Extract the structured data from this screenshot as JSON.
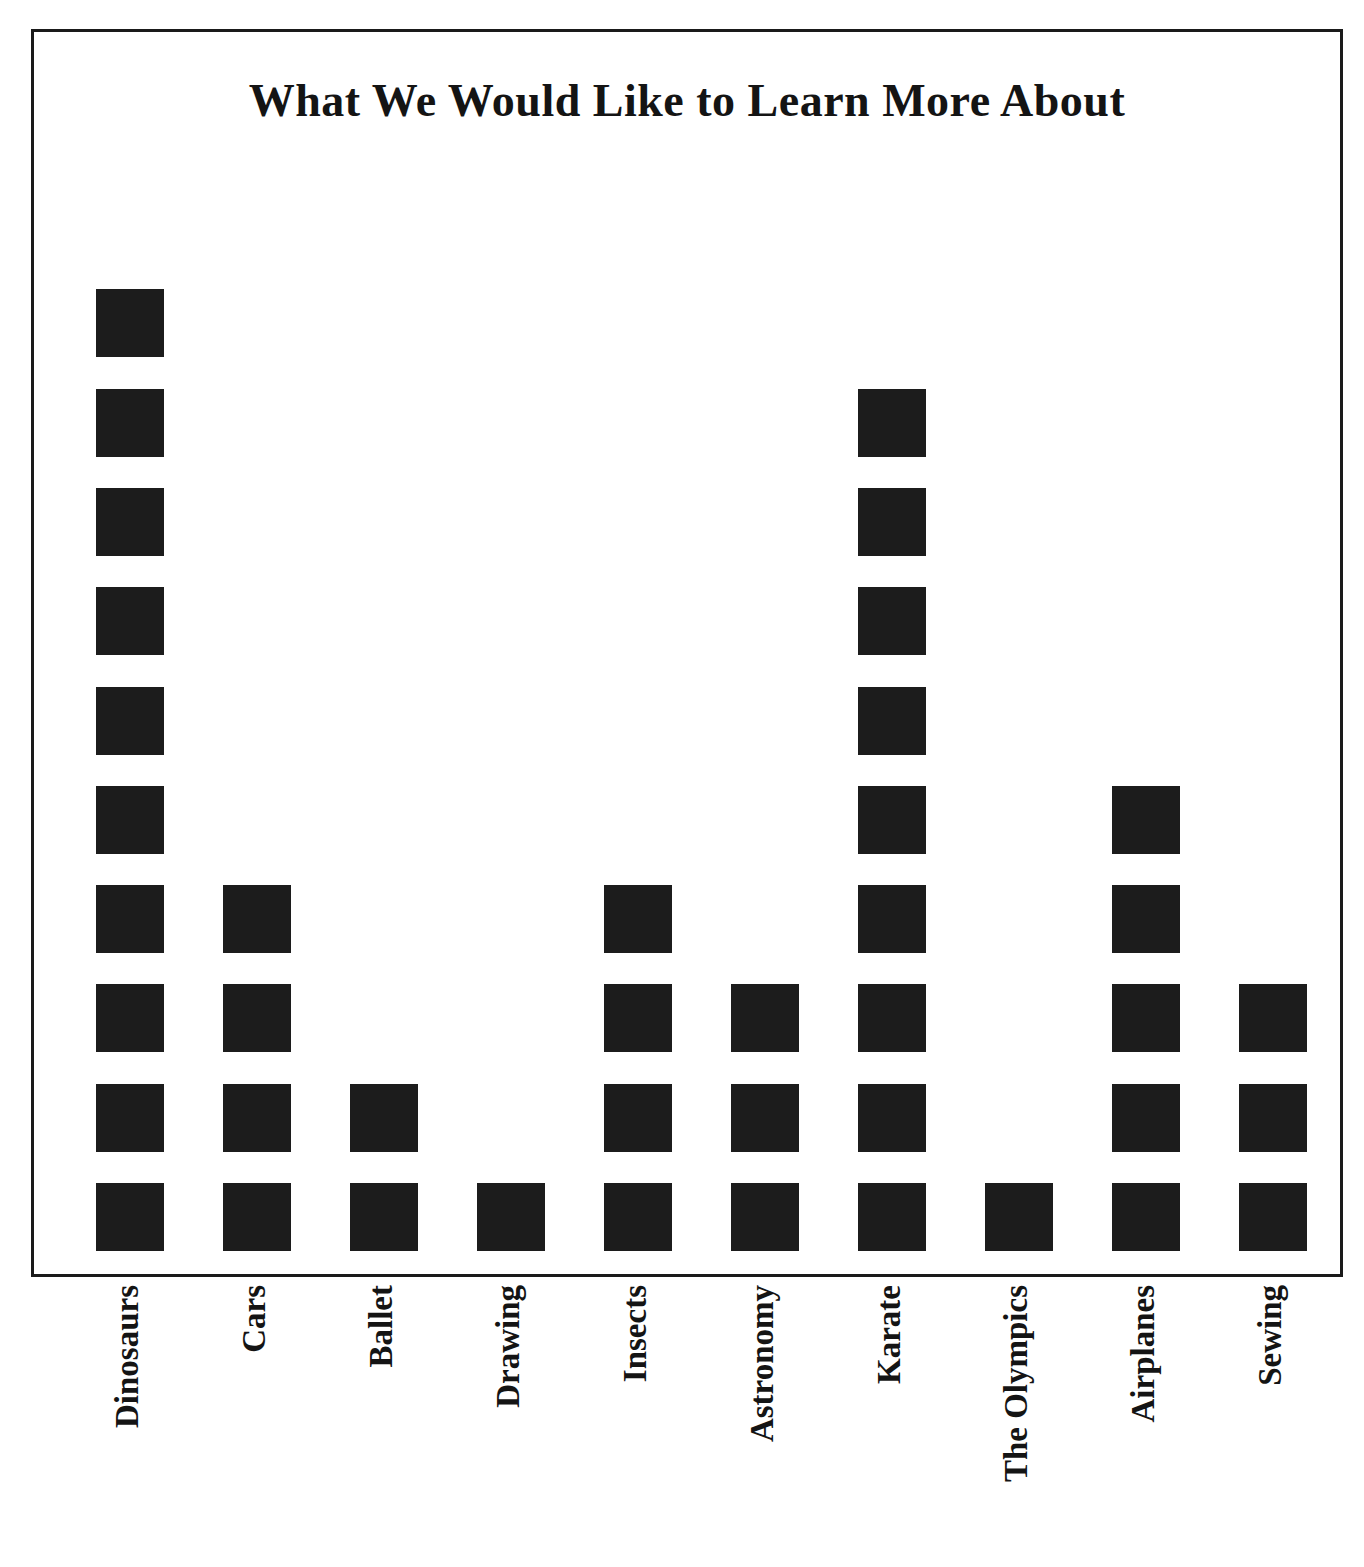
{
  "chart_data": {
    "type": "bar",
    "subtype": "pictograph",
    "title": "What We Would Like to Learn More About",
    "xlabel": "",
    "ylabel": "",
    "categories": [
      "Dinosaurs",
      "Cars",
      "Ballet",
      "Drawing",
      "Insects",
      "Astronomy",
      "Karate",
      "The Olympics",
      "Airplanes",
      "Sewing"
    ],
    "values": [
      10,
      4,
      2,
      1,
      4,
      3,
      9,
      1,
      5,
      3
    ],
    "ylim": [
      0,
      10
    ],
    "grid": false,
    "legend": null,
    "annotations": [],
    "symbol": "filled-square",
    "symbol_value": 1,
    "colors": {
      "symbol": "#1c1c1c",
      "frame": "#1a1a1a",
      "background": "#ffffff",
      "text": "#141414"
    }
  },
  "layout": {
    "frame": {
      "left": 31,
      "top": 29,
      "width": 1312,
      "height": 1248
    },
    "cell_size": 68,
    "row_pitch": 99.3,
    "column_pitch": 127,
    "first_column_left": 62,
    "baseline_bottom": 23
  }
}
